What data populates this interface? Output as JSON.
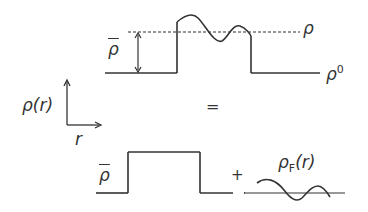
{
  "diagram": {
    "top_panel": {
      "label_rho": "ρ",
      "label_rho0_base": "ρ",
      "label_rho0_sup": "0",
      "label_rhobar": "ρ"
    },
    "axes": {
      "y_label": "ρ(r)",
      "x_label": "r"
    },
    "equals": "=",
    "plus": "+",
    "bottom_left": {
      "label_rhobar": "ρ"
    },
    "bottom_right": {
      "label_base": "ρ",
      "label_sub": "F",
      "label_arg": "(r)"
    },
    "colors": {
      "line": "#333333",
      "text": "#333333"
    }
  }
}
